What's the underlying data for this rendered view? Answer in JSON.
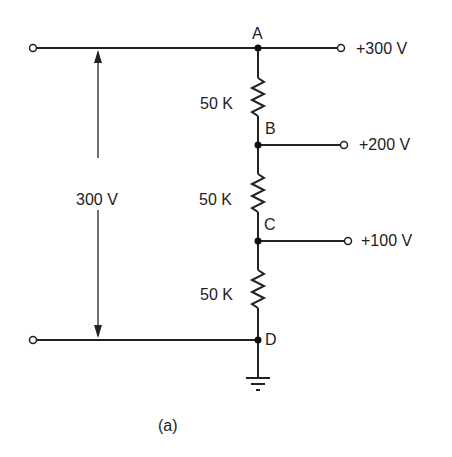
{
  "diagram": {
    "nodes": {
      "A": "A",
      "B": "B",
      "C": "C",
      "D": "D"
    },
    "resistors": [
      {
        "label": "50 K"
      },
      {
        "label": "50 K"
      },
      {
        "label": "50 K"
      }
    ],
    "outputs": [
      {
        "label": "+300 V"
      },
      {
        "label": "+200 V"
      },
      {
        "label": "+100 V"
      }
    ],
    "total_voltage": "300 V",
    "caption": "(a)"
  }
}
